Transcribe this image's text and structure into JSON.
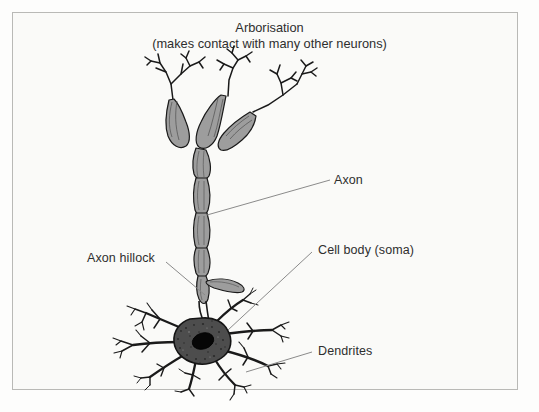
{
  "figure": {
    "kind": "neuron-anatomy-diagram",
    "title_line1": "Arborisation",
    "title_line2": "(makes contact with many other neurons)",
    "background_color": "#fafaf8",
    "frame_color": "#b9b9b6",
    "ink_color": "#1a1a1a",
    "myelin_fill": "#9a9a9a",
    "soma_fill": "#4a4a4a",
    "nucleus_fill": "#000000",
    "leader_color": "#7b7b7b"
  },
  "labels": {
    "arborisation": "Arborisation",
    "arborisation_note": "(makes contact with many other neurons)",
    "axon": "Axon",
    "axon_hillock": "Axon hillock",
    "cell_body": "Cell body (soma)",
    "dendrites": "Dendrites"
  },
  "parts": [
    {
      "name": "arborisation",
      "label": "Arborisation",
      "region": "top"
    },
    {
      "name": "axon",
      "label": "Axon",
      "region": "middle-right"
    },
    {
      "name": "axon-hillock",
      "label": "Axon hillock",
      "region": "middle-left"
    },
    {
      "name": "cell-body",
      "label": "Cell body (soma)",
      "region": "lower-right"
    },
    {
      "name": "dendrites",
      "label": "Dendrites",
      "region": "bottom-right"
    }
  ]
}
